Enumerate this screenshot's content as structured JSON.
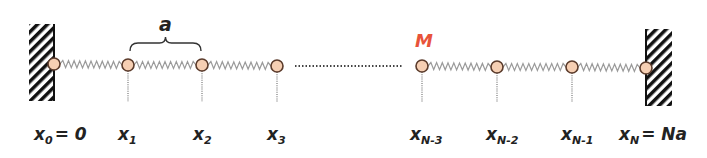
{
  "diagram": {
    "spacing_label": "a",
    "mass_label": "M",
    "colors": {
      "mass_fill": "#f6cfb3",
      "mass_stroke": "#5b3b2b",
      "spring": "#9a9a9a",
      "wall_hatch": "#111111",
      "mass_label": "#e8533a",
      "text": "#222222",
      "dots": "#444444"
    },
    "walls": [
      {
        "name": "left-wall",
        "x": 29,
        "y": 24,
        "width": 25,
        "height": 77
      },
      {
        "name": "right-wall",
        "x": 646,
        "y": 29,
        "width": 26,
        "height": 77
      }
    ],
    "masses": [
      {
        "id": "x0",
        "x": 54,
        "y": 64,
        "label": "x",
        "sub": "0",
        "suffix": "= 0",
        "label_x": 34
      },
      {
        "id": "x1",
        "x": 128,
        "y": 65,
        "label": "x",
        "sub": "1",
        "suffix": "",
        "label_x": 118
      },
      {
        "id": "x2",
        "x": 202,
        "y": 65,
        "label": "x",
        "sub": "2",
        "suffix": "",
        "label_x": 193
      },
      {
        "id": "x3",
        "x": 277,
        "y": 66,
        "label": "x",
        "sub": "3",
        "suffix": "",
        "label_x": 267
      },
      {
        "id": "xN-3",
        "x": 422,
        "y": 66,
        "label": "x",
        "sub": "N-3",
        "suffix": "",
        "label_x": 410
      },
      {
        "id": "xN-2",
        "x": 497,
        "y": 67,
        "label": "x",
        "sub": "N-2",
        "suffix": "",
        "label_x": 486
      },
      {
        "id": "xN-1",
        "x": 572,
        "y": 67,
        "label": "x",
        "sub": "N-1",
        "suffix": "",
        "label_x": 561
      },
      {
        "id": "xN",
        "x": 646,
        "y": 68,
        "label": "x",
        "sub": "N",
        "suffix": "= Na",
        "label_x": 619
      }
    ],
    "springs": [
      [
        "x0",
        "x1"
      ],
      [
        "x1",
        "x2"
      ],
      [
        "x2",
        "x3"
      ],
      [
        "xN-3",
        "xN-2"
      ],
      [
        "xN-2",
        "xN-1"
      ],
      [
        "xN-1",
        "xN"
      ]
    ],
    "ellipsis_line": {
      "x1": 295,
      "x2": 403,
      "y": 66
    },
    "brace": {
      "x1": 130,
      "x2": 201,
      "y": 43
    },
    "labels_y": 140
  }
}
